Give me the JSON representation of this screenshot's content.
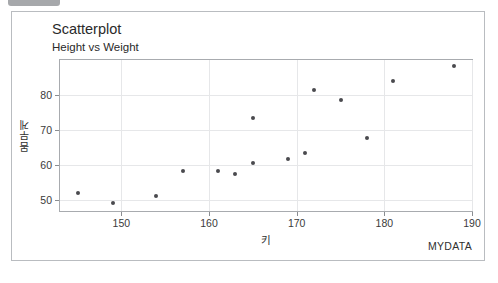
{
  "badge": {
    "name": "clipped-badge"
  },
  "chart_data": {
    "type": "scatter",
    "title": "Scatterplot",
    "subtitle": "Height vs Weight",
    "xlabel": "키",
    "ylabel": "몸무게",
    "footer": "MYDATA",
    "xlim": [
      143,
      190
    ],
    "ylim": [
      47,
      90
    ],
    "xticks": [
      150,
      160,
      170,
      180,
      190
    ],
    "yticks": [
      50,
      60,
      70,
      80
    ],
    "grid": true,
    "legend": null,
    "marker_color": "#4a4a4e",
    "points": [
      {
        "x": 145,
        "y": 52.0
      },
      {
        "x": 149,
        "y": 49.2
      },
      {
        "x": 154,
        "y": 51.2
      },
      {
        "x": 157,
        "y": 58.4
      },
      {
        "x": 161,
        "y": 58.5
      },
      {
        "x": 163,
        "y": 57.6
      },
      {
        "x": 165,
        "y": 60.6
      },
      {
        "x": 165,
        "y": 73.5
      },
      {
        "x": 169,
        "y": 61.7
      },
      {
        "x": 171,
        "y": 63.6
      },
      {
        "x": 172,
        "y": 81.4
      },
      {
        "x": 175,
        "y": 78.7
      },
      {
        "x": 178,
        "y": 67.7
      },
      {
        "x": 181,
        "y": 83.9
      },
      {
        "x": 188,
        "y": 88.4
      }
    ]
  }
}
